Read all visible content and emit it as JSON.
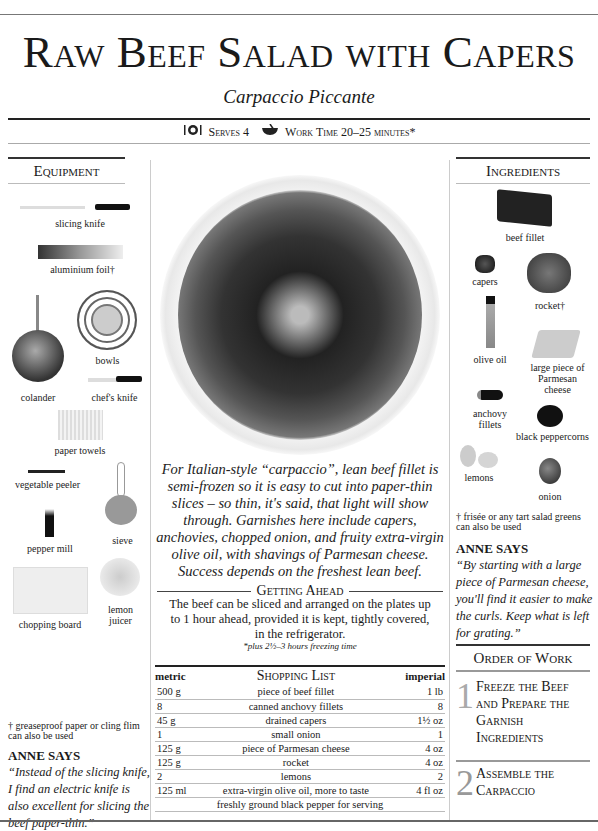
{
  "header": {
    "title": "Raw Beef Salad with Capers",
    "subtitle": "Carpaccio Piccante",
    "serves_icon": "cutlery-plate-icon",
    "serves": "Serves 4",
    "worktime_icon": "mixing-bowl-icon",
    "work_time": "Work Time 20–25 minutes*"
  },
  "equipment": {
    "heading": "Equipment",
    "items": [
      {
        "label": "slicing  knife"
      },
      {
        "label": "aluminium foil†"
      },
      {
        "label": "bowls"
      },
      {
        "label": "colander"
      },
      {
        "label": "chef's knife"
      },
      {
        "label": "paper towels"
      },
      {
        "label": "vegetable peeler"
      },
      {
        "label": "sieve"
      },
      {
        "label": "pepper mill"
      },
      {
        "label": "lemon juicer"
      },
      {
        "label": "chopping board"
      }
    ],
    "footnote": "† greaseproof paper or cling flim can also be used",
    "anne_heading": "ANNE SAYS",
    "anne_quote": "“Instead of the slicing knife, I find an electric knife is also excellent for slicing the beef paper-thin.”"
  },
  "center": {
    "intro": "For Italian-style “carpaccio”, lean beef fillet is semi-frozen so it is easy to cut into paper-thin slices – so thin, it's said, that light will show through. Garnishes here include capers, anchovies, chopped onion, and fruity extra-virgin olive oil, with shavings of Parmesan cheese. Success depends on the freshest lean beef.",
    "getting_ahead_title": "Getting Ahead",
    "getting_ahead_text": "The beef can be sliced and arranged on the plates up to 1 hour ahead, provided it is kept, tightly covered, in the refrigerator.",
    "freezing_note": "*plus 2½–3 hours freezing time"
  },
  "shopping_list": {
    "title": "Shopping List",
    "col_metric": "metric",
    "col_imperial": "imperial",
    "rows": [
      {
        "metric": "500 g",
        "item": "piece of beef fillet",
        "imperial": "1 lb"
      },
      {
        "metric": "8",
        "item": "canned anchovy fillets",
        "imperial": "8"
      },
      {
        "metric": "45 g",
        "item": "drained capers",
        "imperial": "1½ oz"
      },
      {
        "metric": "1",
        "item": "small onion",
        "imperial": "1"
      },
      {
        "metric": "125 g",
        "item": "piece of Parmesan cheese",
        "imperial": "4 oz"
      },
      {
        "metric": "125 g",
        "item": "rocket",
        "imperial": "4 oz"
      },
      {
        "metric": "2",
        "item": "lemons",
        "imperial": "2"
      },
      {
        "metric": "125 ml",
        "item": "extra-virgin olive oil, more to taste",
        "imperial": "4 fl oz"
      },
      {
        "metric": "",
        "item": "freshly ground black pepper for serving",
        "imperial": ""
      }
    ]
  },
  "ingredients": {
    "heading": "Ingredients",
    "items": [
      {
        "label": "beef  fillet"
      },
      {
        "label": "capers"
      },
      {
        "label": "rocket†"
      },
      {
        "label": "olive oil"
      },
      {
        "label": "large piece of Parmesan cheese"
      },
      {
        "label": "anchovy fillets"
      },
      {
        "label": "black peppercorns"
      },
      {
        "label": "lemons"
      },
      {
        "label": "onion"
      }
    ],
    "footnote": "† frisée or any tart salad greens can also be used",
    "anne_heading": "ANNE SAYS",
    "anne_quote": "“By starting with a large piece of Parmesan cheese, you'll  find it easier to make the curls. Keep what is left for grating.”"
  },
  "order_of_work": {
    "heading": "Order of Work",
    "steps": [
      {
        "num": "1",
        "text": "Freeze the Beef and Prepare the Garnish Ingredients"
      },
      {
        "num": "2",
        "text": "Assemble the Carpaccio"
      }
    ]
  }
}
